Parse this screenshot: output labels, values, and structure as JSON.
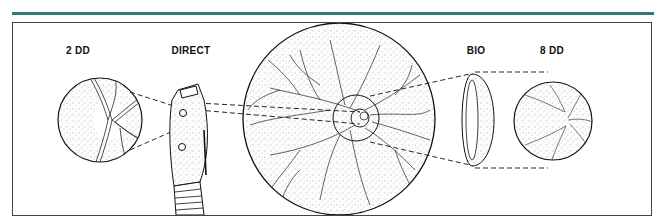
{
  "figure": {
    "accent_color": "#2e7a78",
    "labels": {
      "left_view": "2 DD",
      "direct_instrument": "DIRECT",
      "bio_instrument": "BIO",
      "right_view": "8 DD"
    },
    "elements": [
      {
        "name": "2 DD fundus view",
        "type": "magnified-circle"
      },
      {
        "name": "direct ophthalmoscope",
        "type": "instrument"
      },
      {
        "name": "full fundus",
        "type": "large-circle"
      },
      {
        "name": "BIO condensing lens",
        "type": "lens"
      },
      {
        "name": "8 DD fundus view",
        "type": "magnified-circle"
      }
    ]
  }
}
